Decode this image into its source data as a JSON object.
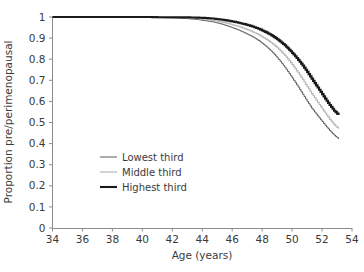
{
  "chart_data": {
    "type": "line",
    "title": "",
    "xlabel": "Age (years)",
    "ylabel": "Proportion pre/perimenopausal",
    "xlim": [
      34,
      54
    ],
    "ylim": [
      0,
      1
    ],
    "grid": false,
    "legend_position": "inside-lower-left",
    "xticks": [
      "34",
      "36",
      "38",
      "40",
      "42",
      "44",
      "46",
      "48",
      "50",
      "52",
      "54"
    ],
    "xtick_values": [
      34,
      36,
      38,
      40,
      42,
      44,
      46,
      48,
      50,
      52,
      54
    ],
    "yticks": [
      "0",
      "0.1",
      "0.2",
      "0.3",
      "0.4",
      "0.5",
      "0.6",
      "0.7",
      "0.8",
      "0.9",
      "1"
    ],
    "ytick_values": [
      0,
      0.1,
      0.2,
      0.3,
      0.4,
      0.5,
      0.6,
      0.7,
      0.8,
      0.9,
      1
    ],
    "series": [
      {
        "name": "Lowest third",
        "color": "#595959",
        "width": 1.0,
        "x": [
          34,
          36,
          38,
          40,
          41,
          42,
          43,
          43.6,
          44.2,
          44.8,
          45.2,
          45.6,
          46,
          46.4,
          46.8,
          47.2,
          47.6,
          48,
          48.3,
          48.6,
          48.9,
          49.2,
          49.5,
          49.8,
          50.1,
          50.4,
          50.7,
          51,
          51.3,
          51.6,
          51.9,
          52.2,
          52.5,
          52.8,
          53.1
        ],
        "y": [
          1,
          1,
          1,
          0.998,
          0.997,
          0.995,
          0.992,
          0.988,
          0.982,
          0.975,
          0.968,
          0.959,
          0.949,
          0.938,
          0.925,
          0.911,
          0.895,
          0.875,
          0.858,
          0.838,
          0.815,
          0.79,
          0.762,
          0.732,
          0.7,
          0.668,
          0.634,
          0.6,
          0.568,
          0.54,
          0.513,
          0.487,
          0.462,
          0.44,
          0.422
        ]
      },
      {
        "name": "Middle third",
        "color": "#b8b8b8",
        "width": 1.2,
        "x": [
          34,
          36,
          38,
          40,
          41,
          42,
          43,
          43.6,
          44.2,
          44.8,
          45.2,
          45.6,
          46,
          46.4,
          46.8,
          47.2,
          47.6,
          48,
          48.3,
          48.6,
          48.9,
          49.2,
          49.5,
          49.8,
          50.1,
          50.4,
          50.7,
          51,
          51.3,
          51.6,
          51.9,
          52.2,
          52.5,
          52.8,
          53.1
        ],
        "y": [
          1,
          1,
          1,
          0.999,
          0.998,
          0.997,
          0.995,
          0.992,
          0.988,
          0.983,
          0.977,
          0.971,
          0.963,
          0.955,
          0.945,
          0.934,
          0.921,
          0.906,
          0.893,
          0.878,
          0.861,
          0.841,
          0.818,
          0.793,
          0.765,
          0.735,
          0.703,
          0.67,
          0.637,
          0.606,
          0.575,
          0.545,
          0.515,
          0.49,
          0.47
        ]
      },
      {
        "name": "Highest third",
        "color": "#1a1a1a",
        "width": 2.1,
        "x": [
          34,
          36,
          38,
          40,
          41,
          42,
          43,
          43.6,
          44.2,
          44.8,
          45.2,
          45.6,
          46,
          46.4,
          46.8,
          47.2,
          47.6,
          48,
          48.3,
          48.6,
          48.9,
          49.2,
          49.5,
          49.8,
          50.1,
          50.4,
          50.7,
          51,
          51.3,
          51.6,
          51.9,
          52.2,
          52.5,
          52.8,
          53.1
        ],
        "y": [
          1,
          1,
          1,
          1,
          0.999,
          0.999,
          0.998,
          0.997,
          0.995,
          0.992,
          0.988,
          0.984,
          0.979,
          0.973,
          0.966,
          0.958,
          0.948,
          0.936,
          0.926,
          0.914,
          0.9,
          0.884,
          0.866,
          0.845,
          0.822,
          0.797,
          0.77,
          0.74,
          0.708,
          0.676,
          0.645,
          0.613,
          0.583,
          0.556,
          0.535
        ]
      }
    ]
  },
  "legend": {
    "items": [
      {
        "label": "Lowest third"
      },
      {
        "label": "Middle third"
      },
      {
        "label": "Highest third"
      }
    ]
  },
  "axes": {
    "x_title": "Age (years)",
    "y_title": "Proportion pre/perimenopausal"
  },
  "colors": {
    "lowest": "#595959",
    "middle": "#b8b8b8",
    "highest": "#1a1a1a",
    "axis": "#8c8c8c",
    "text": "#3a3a3a",
    "background": "#ffffff"
  }
}
